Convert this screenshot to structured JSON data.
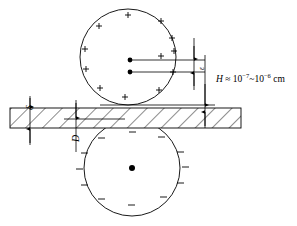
{
  "figure": {
    "background_color": "#ffffff",
    "stroke_color": "#000000",
    "canvas": {
      "width": 297,
      "height": 226
    }
  },
  "labels": {
    "gap_symbol": "H",
    "gap_approx_sign": "≈",
    "gap_mantissa_base": "10",
    "gap_exponent_low": "−7",
    "gap_range_sep": "~",
    "gap_exponent_high": "−6",
    "gap_units": "cm",
    "gap_full_text": "H ≈ 10⁻⁷~10⁻⁶ cm",
    "plate_thickness_symbol": "δ",
    "depth_symbol": "D",
    "separation_symbol": "ε"
  },
  "upper_body": {
    "name": "positively-charged-sphere",
    "charge_sign": "+",
    "charge_count": 12,
    "center": {
      "x": 128,
      "y": 57
    },
    "radius": 48,
    "dot_count": 2,
    "dots": [
      {
        "x": 130,
        "y": 60
      },
      {
        "x": 130,
        "y": 72
      }
    ]
  },
  "lower_body": {
    "name": "negatively-charged-sphere",
    "charge_sign": "−",
    "charge_count": 12,
    "center": {
      "x": 132,
      "y": 168
    },
    "radius": 48,
    "dot_count": 1,
    "dots": [
      {
        "x": 132,
        "y": 168
      }
    ]
  },
  "plate": {
    "name": "hatched-dielectric-plate",
    "left": 10,
    "right": 241,
    "top": 108,
    "bottom": 128,
    "hatch_pattern": "diagonal-45",
    "hatch_spacing": 12
  },
  "dimension_lines": [
    {
      "name": "delta-dimension",
      "x": 30,
      "symbol": "δ"
    },
    {
      "name": "depth-dimension",
      "x": 76,
      "symbol": "D"
    },
    {
      "name": "gap-dimension",
      "x": 205,
      "symbol": "H"
    },
    {
      "name": "epsilon-dimension",
      "x": 194,
      "symbol": "ε"
    }
  ]
}
